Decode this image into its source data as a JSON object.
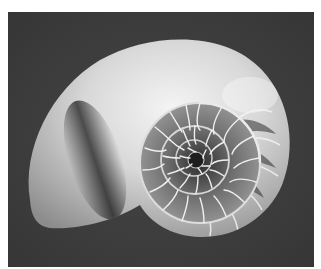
{
  "image": {
    "subject": "nautilus-shell-cross-section",
    "description": "Grayscale photograph of a chambered nautilus shell, half-sectioned to show spiral chambers, on a dark gray background with a white border",
    "colors": {
      "border": "#ffffff",
      "background": "#3e3e3e",
      "shell_highlight": "#f0f0f0",
      "shell_shadow": "#4a4a4a"
    }
  }
}
